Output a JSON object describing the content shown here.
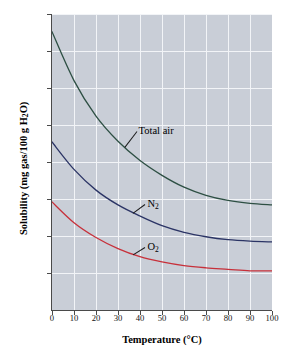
{
  "chart_data": {
    "type": "line",
    "title": "",
    "xlabel": "Temperature (°C)",
    "ylabel": "Solubility (mg gas/100 g H2O)",
    "xlabel_html": "Temperature (&deg;C)",
    "ylabel_html": "Solubility (mg gas/100 g H<sub>2</sub>O)",
    "xlim": [
      0,
      100
    ],
    "ylim": [
      0.0,
      4.0
    ],
    "xticks": [
      0,
      10,
      20,
      30,
      40,
      50,
      60,
      70,
      80,
      90,
      100
    ],
    "xtick_labels": [
      "0",
      "10",
      "20",
      "30",
      "40",
      "50",
      "60",
      "70",
      "80",
      "90",
      "100"
    ],
    "yticks": [
      0.5,
      1.0,
      1.5,
      2.0,
      2.5,
      3.0,
      3.5,
      4.0
    ],
    "ytick_labels": [
      "0.50",
      "1.00",
      "1.50",
      "2.00",
      "2.50",
      "3.00",
      "3.50",
      "4.00"
    ],
    "grid": true,
    "grid_color": "#f2f4f7",
    "plot_background": "#c9ced7",
    "legend": "inline-annotations",
    "x": [
      0,
      10,
      20,
      30,
      40,
      50,
      60,
      70,
      80,
      90,
      100
    ],
    "series": [
      {
        "name": "Total air",
        "color": "#2d4f43",
        "label_html": "Total air",
        "values": [
          3.76,
          3.1,
          2.62,
          2.28,
          2.02,
          1.82,
          1.66,
          1.55,
          1.48,
          1.44,
          1.42
        ]
      },
      {
        "name": "N2",
        "color": "#2b3465",
        "label_html": "N<sub>2</sub>",
        "values": [
          2.27,
          1.9,
          1.62,
          1.42,
          1.27,
          1.14,
          1.05,
          0.99,
          0.95,
          0.93,
          0.92
        ]
      },
      {
        "name": "O2",
        "color": "#c7303a",
        "label_html": "O<sub>2</sub>",
        "values": [
          1.46,
          1.18,
          0.98,
          0.83,
          0.72,
          0.65,
          0.6,
          0.57,
          0.55,
          0.53,
          0.53
        ]
      }
    ],
    "annotations": [
      {
        "text": "Total air",
        "x": 33,
        "y": 2.4
      },
      {
        "text": "N2",
        "x": 37,
        "y": 1.42
      },
      {
        "text": "O2",
        "x": 37,
        "y": 0.84
      }
    ]
  }
}
